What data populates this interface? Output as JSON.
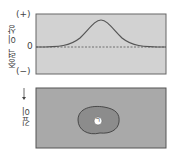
{
  "top_panel": {
    "ylabel": "중력 이상",
    "ticks": {
      "plus": "(+)",
      "zero": "0",
      "minus": "(−)"
    },
    "curve": "gaussian peak above body",
    "colors": {
      "background": "#cfcfcf",
      "curve": "#555555"
    }
  },
  "bottom_panel": {
    "ylabel": "깊이",
    "arrow": "down-arrow",
    "body_label": "ㄱ",
    "colors": {
      "rock": "#a8a8a8",
      "body": "#8a8a8a",
      "outline": "#333333"
    }
  }
}
